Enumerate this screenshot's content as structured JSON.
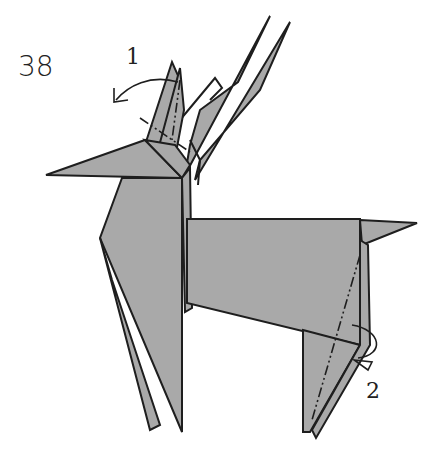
{
  "diagram": {
    "step_number": "38",
    "fold_labels": [
      {
        "id": "1",
        "text": "1",
        "type": "mountain-fold",
        "location": "ears"
      },
      {
        "id": "2",
        "text": "2",
        "type": "mountain-fold",
        "location": "hind-leg"
      }
    ],
    "colors": {
      "paper": "#a9a9a9",
      "outline": "#1e1e1e",
      "background": "#ffffff"
    }
  }
}
